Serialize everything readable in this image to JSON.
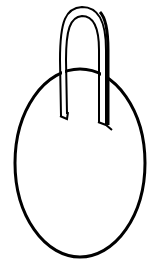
{
  "image": {
    "subject": "hanging oval tag with strap loop",
    "style": "black ink line drawing on white",
    "colors": {
      "ink": "#000000",
      "background": "#ffffff"
    }
  }
}
